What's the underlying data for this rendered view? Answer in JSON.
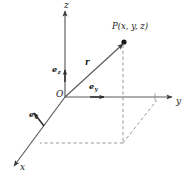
{
  "figure": {
    "background_color": "#ffffff",
    "line_color": "#4d4d4d",
    "text_color": "#1a1a1a",
    "width": 193,
    "height": 180
  },
  "axes": [
    {
      "id": "z",
      "label": "z",
      "direction": "up",
      "label_x": 64,
      "label_y": 2
    },
    {
      "id": "y",
      "label": "y",
      "direction": "right",
      "label_x": 176,
      "label_y": 101
    },
    {
      "id": "x",
      "label": "x",
      "direction": "down-left",
      "label_x": 20,
      "label_y": 166
    }
  ],
  "origin": {
    "label": "O",
    "label_x": 56,
    "label_y": 92
  },
  "point": {
    "label": "P(x, y, z)",
    "label_x": 113,
    "label_y": 24,
    "dot_x": 124,
    "dot_y": 42
  },
  "vectors": [
    {
      "id": "r",
      "label": "r",
      "label_x": 85,
      "label_y": 60,
      "from": "O",
      "to": "P"
    },
    {
      "id": "e_z",
      "base": "e",
      "sub": "z",
      "label": "ez",
      "label_x": 52,
      "label_y": 66,
      "direction": "up"
    },
    {
      "id": "e_y",
      "base": "e",
      "sub": "y",
      "label": "ey",
      "label_x": 88,
      "label_y": 83,
      "direction": "right"
    },
    {
      "id": "e_x",
      "base": "e",
      "sub": "x",
      "label": "ex",
      "label_x": 31,
      "label_y": 112,
      "direction": "down-left"
    }
  ],
  "projection_lines": {
    "style": "dashed",
    "description": "dashed projection box from P down to the xy-plane"
  }
}
